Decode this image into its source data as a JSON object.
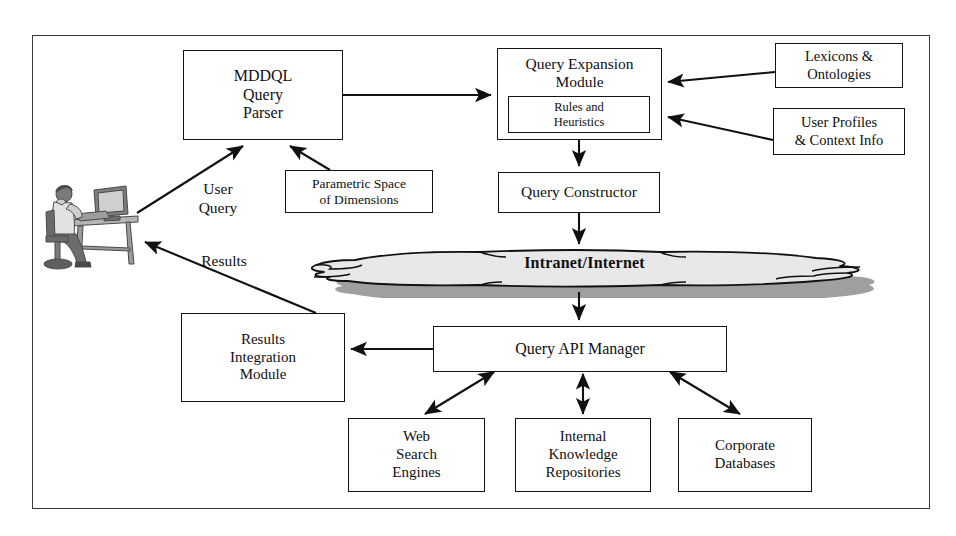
{
  "diagram": {
    "frame": {
      "border_color": "#3a3a3a"
    },
    "nodes": {
      "mddql_query_parser": {
        "label": "MDDQL\nQuery\nParser"
      },
      "query_expansion_module": {
        "label": "Query Expansion\nModule"
      },
      "rules_and_heuristics": {
        "label": "Rules and\nHeuristics"
      },
      "lexicons_ontologies": {
        "label": "Lexicons &\nOntologies"
      },
      "user_profiles_context": {
        "label": "User Profiles\n& Context Info"
      },
      "parametric_space": {
        "label": "Parametric Space\nof Dimensions"
      },
      "query_constructor": {
        "label": "Query Constructor"
      },
      "query_api_manager": {
        "label": "Query API Manager"
      },
      "results_integration_module": {
        "label": "Results\nIntegration\nModule"
      },
      "web_search_engines": {
        "label": "Web\nSearch\nEngines"
      },
      "internal_knowledge_repositories": {
        "label": "Internal\nKnowledge\nRepositories"
      },
      "corporate_databases": {
        "label": "Corporate\nDatabases"
      }
    },
    "cloud": {
      "label": "Intranet/Internet",
      "fill": "#e8e8e8",
      "shadow": "#9a9a9a",
      "stroke": "#111111"
    },
    "edge_labels": {
      "user_query": "User\nQuery",
      "results": "Results"
    },
    "actor": {
      "name": "user-at-workstation",
      "tone": "#8a8a8a"
    },
    "edges": [
      {
        "from": "user",
        "to": "mddql_query_parser",
        "label": "User Query",
        "arrow": "single"
      },
      {
        "from": "parametric_space",
        "to": "mddql_query_parser",
        "label": "",
        "arrow": "single"
      },
      {
        "from": "mddql_query_parser",
        "to": "query_expansion_module",
        "label": "",
        "arrow": "single"
      },
      {
        "from": "lexicons_ontologies",
        "to": "query_expansion_module",
        "label": "",
        "arrow": "single"
      },
      {
        "from": "user_profiles_context",
        "to": "rules_and_heuristics",
        "label": "",
        "arrow": "single"
      },
      {
        "from": "query_expansion_module",
        "to": "query_constructor",
        "label": "",
        "arrow": "single"
      },
      {
        "from": "query_constructor",
        "to": "cloud",
        "label": "",
        "arrow": "single"
      },
      {
        "from": "cloud",
        "to": "query_api_manager",
        "label": "",
        "arrow": "single"
      },
      {
        "from": "query_api_manager",
        "to": "results_integration_module",
        "label": "",
        "arrow": "single"
      },
      {
        "from": "results_integration_module",
        "to": "user",
        "label": "Results",
        "arrow": "single"
      },
      {
        "from": "query_api_manager",
        "to": "web_search_engines",
        "label": "",
        "arrow": "double"
      },
      {
        "from": "query_api_manager",
        "to": "internal_knowledge_repositories",
        "label": "",
        "arrow": "double"
      },
      {
        "from": "query_api_manager",
        "to": "corporate_databases",
        "label": "",
        "arrow": "double"
      }
    ]
  }
}
